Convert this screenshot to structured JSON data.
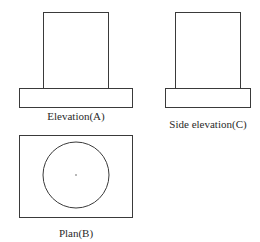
{
  "views": {
    "elevation": {
      "label": "Elevation(A)",
      "column": {
        "x": 43,
        "y": 12,
        "w": 65,
        "h": 76
      },
      "base": {
        "x": 19,
        "y": 88,
        "w": 113,
        "h": 19
      },
      "label_pos": {
        "x": 76,
        "y": 111
      }
    },
    "side_elevation": {
      "label": "Side elevation(C)",
      "column": {
        "x": 175,
        "y": 12,
        "w": 65,
        "h": 76
      },
      "base": {
        "x": 165,
        "y": 88,
        "w": 85,
        "h": 19
      },
      "label_pos": {
        "x": 208,
        "y": 119
      }
    },
    "plan": {
      "label": "Plan(B)",
      "outline": {
        "x": 19,
        "y": 135,
        "w": 113,
        "h": 82
      },
      "circle": {
        "cx": 76,
        "cy": 175,
        "r": 33
      },
      "label_pos": {
        "x": 76,
        "y": 228
      }
    }
  },
  "colors": {
    "line": "#3a3a3a",
    "background": "#ffffff"
  }
}
